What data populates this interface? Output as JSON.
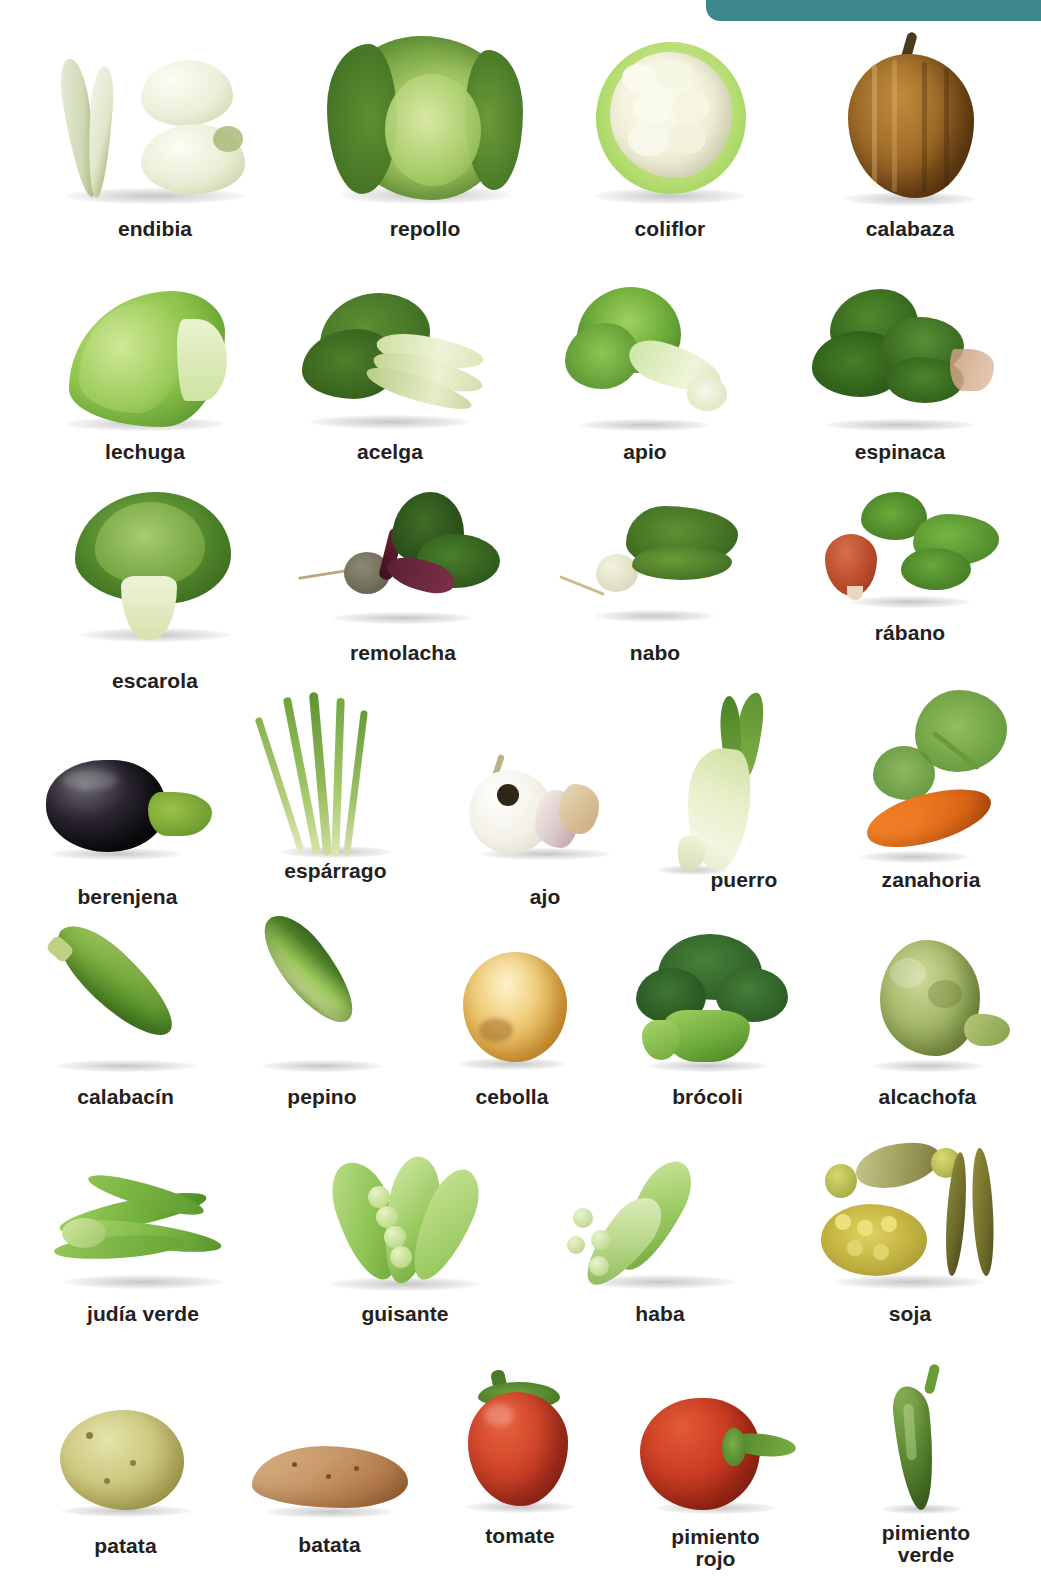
{
  "page": {
    "background_color": "#ffffff",
    "accent_color": "#3d888c",
    "label_color": "#232021"
  },
  "decor": {
    "tab": {
      "name": "teal-corner-tab",
      "color": "#3d888c"
    }
  },
  "rows": [
    {
      "id": "row-1",
      "items": [
        {
          "label": "endibia",
          "icon": "endive-photo"
        },
        {
          "label": "repollo",
          "icon": "cabbage-photo"
        },
        {
          "label": "coliflor",
          "icon": "cauliflower-photo"
        },
        {
          "label": "calabaza",
          "icon": "pumpkin-photo"
        }
      ]
    },
    {
      "id": "row-2",
      "items": [
        {
          "label": "lechuga",
          "icon": "lettuce-photo"
        },
        {
          "label": "acelga",
          "icon": "chard-photo"
        },
        {
          "label": "apio",
          "icon": "celery-photo"
        },
        {
          "label": "espinaca",
          "icon": "spinach-photo"
        }
      ]
    },
    {
      "id": "row-3",
      "items": [
        {
          "label": "escarola",
          "icon": "escarole-photo"
        },
        {
          "label": "remolacha",
          "icon": "beet-photo"
        },
        {
          "label": "nabo",
          "icon": "turnip-photo"
        },
        {
          "label": "rábano",
          "icon": "radish-photo"
        }
      ]
    },
    {
      "id": "row-4",
      "items": [
        {
          "label": "berenjena",
          "icon": "eggplant-photo"
        },
        {
          "label": "espárrago",
          "icon": "asparagus-photo"
        },
        {
          "label": "ajo",
          "icon": "garlic-photo"
        },
        {
          "label": "puerro",
          "icon": "leek-photo"
        },
        {
          "label": "zanahoria",
          "icon": "carrot-photo"
        }
      ]
    },
    {
      "id": "row-5",
      "items": [
        {
          "label": "calabacín",
          "icon": "zucchini-photo"
        },
        {
          "label": "pepino",
          "icon": "cucumber-photo"
        },
        {
          "label": "cebolla",
          "icon": "onion-photo"
        },
        {
          "label": "brócoli",
          "icon": "broccoli-photo"
        },
        {
          "label": "alcachofa",
          "icon": "artichoke-photo"
        }
      ]
    },
    {
      "id": "row-6",
      "items": [
        {
          "label": "judía verde",
          "icon": "green-bean-photo"
        },
        {
          "label": "guisante",
          "icon": "pea-photo"
        },
        {
          "label": "haba",
          "icon": "broad-bean-photo"
        },
        {
          "label": "soja",
          "icon": "soybean-photo"
        }
      ]
    },
    {
      "id": "row-7",
      "items": [
        {
          "label": "patata",
          "icon": "potato-photo"
        },
        {
          "label": "batata",
          "icon": "sweet-potato-photo"
        },
        {
          "label": "tomate",
          "icon": "tomato-photo"
        },
        {
          "label": "pimiento\nrojo",
          "icon": "red-pepper-photo"
        },
        {
          "label": "pimiento\nverde",
          "icon": "green-pepper-photo"
        }
      ]
    }
  ]
}
